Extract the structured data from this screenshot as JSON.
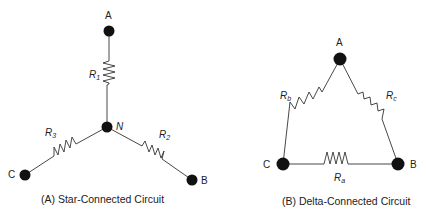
{
  "star": {
    "caption": "(A) Star-Connected Circuit",
    "nodes": {
      "a": "A",
      "b": "B",
      "c": "C",
      "n": "N"
    },
    "resistors": {
      "r1": {
        "base": "R",
        "sub": "1"
      },
      "r2": {
        "base": "R",
        "sub": "2"
      },
      "r3": {
        "base": "R",
        "sub": "3"
      }
    }
  },
  "delta": {
    "caption": "(B) Delta-Connected Circuit",
    "nodes": {
      "a": "A",
      "b": "B",
      "c": "C"
    },
    "resistors": {
      "ra": {
        "base": "R",
        "sub": "a"
      },
      "rb": {
        "base": "R",
        "sub": "b"
      },
      "rc": {
        "base": "R",
        "sub": "c"
      }
    }
  }
}
